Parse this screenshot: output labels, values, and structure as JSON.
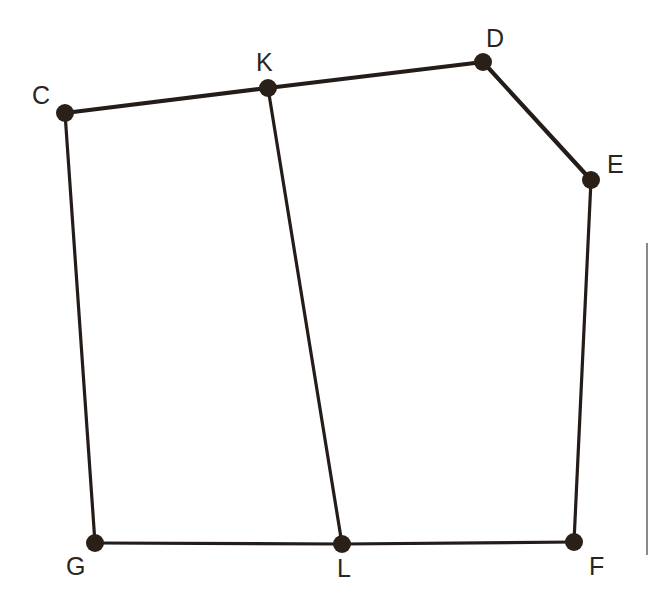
{
  "figure": {
    "background_color": "#ffffff",
    "stroke_color": "#231c19",
    "node_fill_color": "#2b2018",
    "label_color": "#2b2420",
    "node_radius": 9,
    "width": 651,
    "height": 604
  },
  "nodes": [
    {
      "id": "C",
      "label": "C",
      "x": 65,
      "y": 113,
      "label_x": 32,
      "label_y": 83,
      "radius": 9
    },
    {
      "id": "K",
      "label": "K",
      "x": 268,
      "y": 88,
      "label_x": 256,
      "label_y": 50,
      "radius": 9
    },
    {
      "id": "D",
      "label": "D",
      "x": 483,
      "y": 62,
      "label_x": 486,
      "label_y": 26,
      "radius": 9
    },
    {
      "id": "E",
      "label": "E",
      "x": 591,
      "y": 180,
      "label_x": 607,
      "label_y": 152,
      "radius": 9
    },
    {
      "id": "F",
      "label": "F",
      "x": 574,
      "y": 542,
      "label_x": 589,
      "label_y": 554,
      "radius": 9
    },
    {
      "id": "L",
      "label": "L",
      "x": 342,
      "y": 544,
      "label_x": 337,
      "label_y": 556,
      "radius": 9
    },
    {
      "id": "G",
      "label": "G",
      "x": 95,
      "y": 543,
      "label_x": 66,
      "label_y": 554,
      "radius": 9
    }
  ],
  "edges": [
    {
      "id": "C-K",
      "from": "C",
      "to": "K",
      "width": 4.2
    },
    {
      "id": "K-D",
      "from": "K",
      "to": "D",
      "width": 4.2
    },
    {
      "id": "D-E",
      "from": "D",
      "to": "E",
      "width": 4.2
    },
    {
      "id": "E-F",
      "from": "E",
      "to": "F",
      "width": 3.2
    },
    {
      "id": "F-L",
      "from": "F",
      "to": "L",
      "width": 3.2
    },
    {
      "id": "L-G",
      "from": "L",
      "to": "G",
      "width": 3.2
    },
    {
      "id": "G-C",
      "from": "G",
      "to": "C",
      "width": 3.2
    },
    {
      "id": "K-L",
      "from": "K",
      "to": "L",
      "width": 3.2
    }
  ],
  "artifacts": {
    "scan_line": {
      "name": "page-edge-scan-line",
      "x": 646,
      "y": 243,
      "width": 2,
      "height": 312,
      "color": "#8a8a8a"
    }
  }
}
